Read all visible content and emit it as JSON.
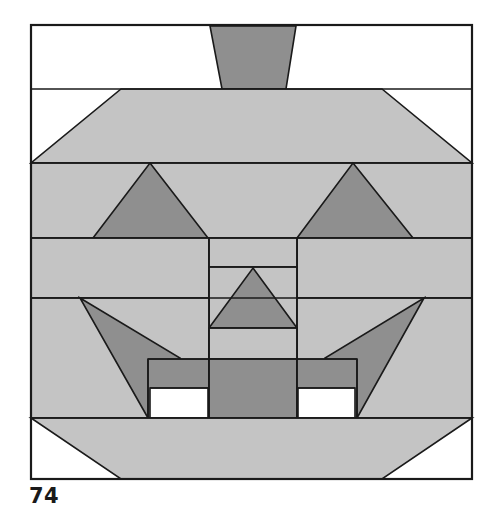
{
  "figure": {
    "caption": "74",
    "title": "Jack-o'-lantern pieced quilt block diagram",
    "frame": {
      "x": 31,
      "y": 25,
      "width": 441,
      "height": 454
    },
    "colors": {
      "background": "#ffffff",
      "outline": "#1a1a1a",
      "light_fill": "#c4c4c4",
      "dark_fill": "#8f8f8f",
      "white_fill": "#ffffff",
      "caption_color": "#1a1a1a"
    },
    "stroke_width": 1.6,
    "rows": [
      {
        "name": "row-stem",
        "y_top": 25,
        "y_bottom": 89
      },
      {
        "name": "row-upper-shoulder",
        "y_top": 89,
        "y_bottom": 163
      },
      {
        "name": "row-eyes",
        "y_top": 163,
        "y_bottom": 238
      },
      {
        "name": "row-upper-cheek",
        "y_top": 238,
        "y_bottom": 298
      },
      {
        "name": "row-lower-cheek",
        "y_top": 298,
        "y_bottom": 418
      },
      {
        "name": "row-bottom",
        "y_top": 418,
        "y_bottom": 479
      }
    ],
    "columns": {
      "left_edge": 31,
      "center_left": 209,
      "center_right": 297,
      "right_edge": 472
    },
    "shapes": [
      {
        "name": "stem-trapezoid",
        "kind": "polygon",
        "fill": "dark",
        "points": "210,26 296,26 286,89 222,89"
      },
      {
        "name": "head-top-trapezoid",
        "kind": "polygon",
        "fill": "light",
        "points": "121,89 382,89 472,163 31,163"
      },
      {
        "name": "eye-row-background",
        "kind": "polygon",
        "fill": "light",
        "points": "31,163 472,163 472,238 31,238"
      },
      {
        "name": "left-eye-triangle",
        "kind": "polygon",
        "fill": "dark",
        "points": "150,163 208,238 93,238"
      },
      {
        "name": "right-eye-triangle",
        "kind": "polygon",
        "fill": "dark",
        "points": "353,163 413,238 297,238"
      },
      {
        "name": "upper-cheek-left-block",
        "kind": "polygon",
        "fill": "light",
        "points": "31,238 209,238 209,298 31,298"
      },
      {
        "name": "upper-cheek-right-block",
        "kind": "polygon",
        "fill": "light",
        "points": "297,238 472,238 472,298 297,298"
      },
      {
        "name": "nose-upper-block",
        "kind": "polygon",
        "fill": "light",
        "points": "209,238 297,238 297,267 209,267"
      },
      {
        "name": "nose-triangle-background",
        "kind": "polygon",
        "fill": "light",
        "points": "209,267 297,267 297,328 209,328"
      },
      {
        "name": "nose-triangle",
        "kind": "polygon",
        "fill": "dark",
        "points": "253,268 297,328 209,328"
      },
      {
        "name": "lower-cheek-left-block",
        "kind": "polygon",
        "fill": "light",
        "points": "31,298 209,298 209,418 31,418"
      },
      {
        "name": "lower-cheek-right-block",
        "kind": "polygon",
        "fill": "light",
        "points": "297,298 472,298 472,418 297,418"
      },
      {
        "name": "nose-lower-block",
        "kind": "polygon",
        "fill": "light",
        "points": "209,328 297,328 297,359 209,359"
      },
      {
        "name": "left-cheek-triangle",
        "kind": "polygon",
        "fill": "dark",
        "points": "80,298 180,358 148,418"
      },
      {
        "name": "right-cheek-triangle",
        "kind": "polygon",
        "fill": "dark",
        "points": "424,298 357,418 325,358"
      },
      {
        "name": "mouth-left-bar",
        "kind": "polygon",
        "fill": "dark",
        "points": "148,359 209,359 209,418 148,418"
      },
      {
        "name": "mouth-center-bar",
        "kind": "polygon",
        "fill": "dark",
        "points": "209,359 297,359 297,418 209,418"
      },
      {
        "name": "mouth-right-bar",
        "kind": "polygon",
        "fill": "dark",
        "points": "297,359 357,359 357,418 297,418"
      },
      {
        "name": "left-tooth",
        "kind": "polygon",
        "fill": "white",
        "points": "150,388 208,388 208,418 150,418"
      },
      {
        "name": "right-tooth",
        "kind": "polygon",
        "fill": "white",
        "points": "298,388 355,388 355,418 298,418"
      },
      {
        "name": "bottom-trapezoid",
        "kind": "polygon",
        "fill": "light",
        "points": "31,418 472,418 382,479 121,479"
      }
    ],
    "lines": [
      {
        "name": "row-divider-stem",
        "x1": 31,
        "y1": 89,
        "x2": 472,
        "y2": 89
      },
      {
        "name": "row-divider-shoulder",
        "x1": 31,
        "y1": 163,
        "x2": 472,
        "y2": 163
      },
      {
        "name": "row-divider-eyes",
        "x1": 31,
        "y1": 238,
        "x2": 472,
        "y2": 238
      },
      {
        "name": "row-divider-upper-cheek",
        "x1": 31,
        "y1": 298,
        "x2": 472,
        "y2": 298
      },
      {
        "name": "row-divider-mouth",
        "x1": 31,
        "y1": 418,
        "x2": 472,
        "y2": 418
      },
      {
        "name": "center-column-left",
        "x1": 209,
        "y1": 238,
        "x2": 209,
        "y2": 418
      },
      {
        "name": "center-column-right",
        "x1": 297,
        "y1": 238,
        "x2": 297,
        "y2": 418
      },
      {
        "name": "nose-block-top",
        "x1": 209,
        "y1": 267,
        "x2": 297,
        "y2": 267
      },
      {
        "name": "nose-block-bottom",
        "x1": 209,
        "y1": 328,
        "x2": 297,
        "y2": 328
      },
      {
        "name": "mouth-band-top",
        "x1": 148,
        "y1": 359,
        "x2": 357,
        "y2": 359
      },
      {
        "name": "mouth-left-edge",
        "x1": 148,
        "y1": 359,
        "x2": 148,
        "y2": 418
      },
      {
        "name": "mouth-right-edge",
        "x1": 357,
        "y1": 359,
        "x2": 357,
        "y2": 418
      },
      {
        "name": "left-tooth-top",
        "x1": 150,
        "y1": 388,
        "x2": 208,
        "y2": 388
      },
      {
        "name": "right-tooth-top",
        "x1": 298,
        "y1": 388,
        "x2": 355,
        "y2": 388
      }
    ],
    "border": {
      "name": "figure-frame",
      "x": 31,
      "y": 25,
      "width": 441,
      "height": 454
    }
  }
}
